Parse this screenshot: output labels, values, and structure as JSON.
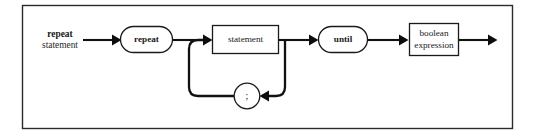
{
  "diagram": {
    "kind": "railroad-syntax-diagram",
    "title_label": {
      "line1": "repeat",
      "line2": "statement"
    },
    "frame": {
      "x": 22,
      "y": 5,
      "width": 491,
      "height": 124,
      "border_color": "#2b2b2b"
    },
    "colors": {
      "rail": "#111111",
      "node_stroke": "#1a1a1a",
      "node_fill": "#ffffff",
      "arrow": "#0d0d0d",
      "background": "#ffffff",
      "text": "#1a1a1a"
    },
    "nodes": [
      {
        "id": "repeat-keyword",
        "label": "repeat",
        "shape": "stadium",
        "kind": "terminal",
        "x": 120,
        "y": 26,
        "width": 53,
        "height": 27
      },
      {
        "id": "statement",
        "label": "statement",
        "shape": "rectangle",
        "kind": "nonterminal",
        "x": 212,
        "y": 25,
        "width": 67,
        "height": 29
      },
      {
        "id": "semicolon",
        "label": ";",
        "shape": "circle",
        "kind": "terminal",
        "cx": 247,
        "cy": 96,
        "r": 13
      },
      {
        "id": "until-keyword",
        "label": "until",
        "shape": "stadium",
        "kind": "terminal",
        "x": 318,
        "y": 26,
        "width": 50,
        "height": 27
      },
      {
        "id": "boolean-expression",
        "label_line1": "boolean",
        "label_line2": "expression",
        "shape": "rectangle",
        "kind": "nonterminal",
        "x": 409,
        "y": 23,
        "width": 50,
        "height": 33
      }
    ],
    "rails": {
      "main_line_y": 40,
      "loop_line_y": 96,
      "entry_x": 83,
      "exit_x": 497
    },
    "grammar_reading": "repeat statement { ; statement } until boolean expression"
  }
}
